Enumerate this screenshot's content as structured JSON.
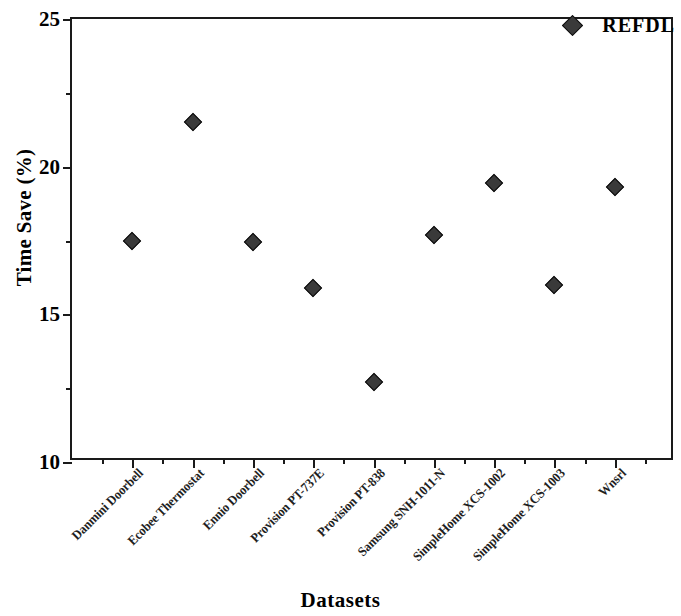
{
  "chart_data": {
    "type": "scatter",
    "title": "",
    "xlabel": "Datasets",
    "ylabel": "Time Save (%)",
    "ylim": [
      10,
      25
    ],
    "yticks": [
      10,
      15,
      20,
      25
    ],
    "ytick_labels": [
      "10",
      "15",
      "20",
      "25"
    ],
    "y_minor_ticks": [
      12.5,
      17.5,
      22.5
    ],
    "grid": false,
    "legend": {
      "position": "top-right",
      "entries": [
        {
          "name": "REFDL",
          "marker": "diamond",
          "color": "#3a3a3a"
        }
      ]
    },
    "categories": [
      "Danmini Doorbell",
      "Ecobee Thermostat",
      "Ennio Doorbell",
      "Provision PT-737E",
      "Provision PT-838",
      "Samsung SNH-1011-N",
      "SimpleHome XCS-1002",
      "SimpleHome XCS-1003",
      "Wnsrl"
    ],
    "series": [
      {
        "name": "REFDL",
        "marker": "diamond",
        "color": "#3a3a3a",
        "values": [
          17.5,
          21.5,
          17.45,
          15.9,
          12.7,
          17.7,
          19.45,
          16.0,
          19.3
        ]
      }
    ]
  }
}
